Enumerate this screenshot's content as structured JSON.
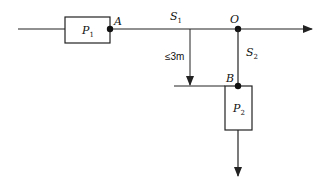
{
  "diagram": {
    "labels": {
      "P1_main": "P",
      "P1_sub": "1",
      "P2_main": "P",
      "P2_sub": "2",
      "A": "A",
      "O": "O",
      "B": "B",
      "S1_main": "S",
      "S1_sub": "1",
      "S2_main": "S",
      "S2_sub": "2",
      "distance": "≤3m"
    },
    "colors": {
      "stroke": "#222222",
      "background": "#ffffff"
    }
  }
}
